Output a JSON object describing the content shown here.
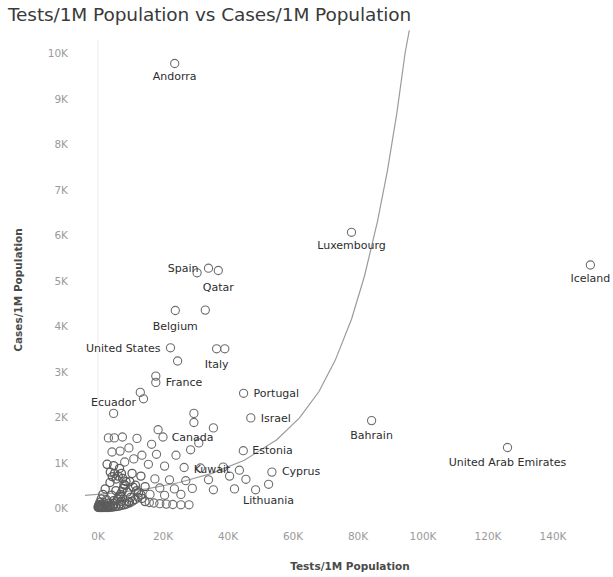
{
  "chart_data": {
    "type": "scatter",
    "title": "Tests/1M Population vs Cases/1M Population",
    "xlabel": "Tests/1M Population",
    "ylabel": "Cases/1M Population",
    "xlim": [
      -4000,
      150000
    ],
    "ylim": [
      0,
      10500
    ],
    "xticks": [
      "0K",
      "20K",
      "40K",
      "60K",
      "80K",
      "100K",
      "120K",
      "140K"
    ],
    "xtick_values": [
      0,
      20000,
      40000,
      60000,
      80000,
      100000,
      120000,
      140000
    ],
    "yticks": [
      "0K",
      "1K",
      "2K",
      "3K",
      "4K",
      "5K",
      "6K",
      "7K",
      "8K",
      "9K",
      "10K"
    ],
    "ytick_values": [
      0,
      1000,
      2000,
      3000,
      4000,
      5000,
      6000,
      7000,
      8000,
      9000,
      10000
    ],
    "grid": false,
    "legend": "none",
    "marker": "open-circle",
    "trendline": {
      "present": true,
      "style": "exponential-curve",
      "color": "#9b9b9b"
    },
    "labeled_points": [
      {
        "name": "Andorra",
        "x": 23600,
        "y": 9770,
        "label_dx": 0,
        "label_dy": 16,
        "label_anchor": "middle"
      },
      {
        "name": "Luxembourg",
        "x": 78000,
        "y": 6060,
        "label_dx": 0,
        "label_dy": 17,
        "label_anchor": "middle"
      },
      {
        "name": "Iceland",
        "x": 151500,
        "y": 5340,
        "label_dx": 0,
        "label_dy": 17,
        "label_anchor": "middle"
      },
      {
        "name": "Spain",
        "x": 34000,
        "y": 5270,
        "label_dx": -10,
        "label_dy": 4,
        "label_anchor": "end"
      },
      {
        "name": "Qatar",
        "x": 37000,
        "y": 5220,
        "label_dx": 0,
        "label_dy": 20,
        "label_anchor": "middle"
      },
      {
        "name": "Belgium",
        "x": 23800,
        "y": 4340,
        "label_dx": 0,
        "label_dy": 19,
        "label_anchor": "middle"
      },
      {
        "name": "United States",
        "x": 22300,
        "y": 3520,
        "label_dx": -10,
        "label_dy": 4,
        "label_anchor": "end"
      },
      {
        "name": "Italy",
        "x": 36500,
        "y": 3500,
        "label_dx": 0,
        "label_dy": 19,
        "label_anchor": "middle"
      },
      {
        "name": "France",
        "x": 17800,
        "y": 2760,
        "label_dx": 10,
        "label_dy": 4,
        "label_anchor": "start"
      },
      {
        "name": "Portugal",
        "x": 44800,
        "y": 2520,
        "label_dx": 10,
        "label_dy": 4,
        "label_anchor": "start"
      },
      {
        "name": "Ecuador",
        "x": 4800,
        "y": 2080,
        "label_dx": 0,
        "label_dy": -7,
        "label_anchor": "middle"
      },
      {
        "name": "Israel",
        "x": 47000,
        "y": 1980,
        "label_dx": 10,
        "label_dy": 4,
        "label_anchor": "start"
      },
      {
        "name": "Bahrain",
        "x": 84200,
        "y": 1920,
        "label_dx": 0,
        "label_dy": 18,
        "label_anchor": "middle"
      },
      {
        "name": "Canada",
        "x": 28500,
        "y": 1280,
        "label_dx": 2,
        "label_dy": -9,
        "label_anchor": "middle"
      },
      {
        "name": "Estonia",
        "x": 44700,
        "y": 1260,
        "label_dx": 9,
        "label_dy": 3,
        "label_anchor": "start"
      },
      {
        "name": "United Arab Emirates",
        "x": 126000,
        "y": 1330,
        "label_dx": 0,
        "label_dy": 18,
        "label_anchor": "middle"
      },
      {
        "name": "Kuwait",
        "x": 43500,
        "y": 830,
        "label_dx": -9,
        "label_dy": 3,
        "label_anchor": "end"
      },
      {
        "name": "Cyprus",
        "x": 53500,
        "y": 790,
        "label_dx": 10,
        "label_dy": 3,
        "label_anchor": "start"
      },
      {
        "name": "Lithuania",
        "x": 52500,
        "y": 520,
        "label_dx": 0,
        "label_dy": 20,
        "label_anchor": "middle"
      }
    ],
    "unlabeled_points": [
      {
        "x": 30500,
        "y": 5170
      },
      {
        "x": 33000,
        "y": 4350
      },
      {
        "x": 39000,
        "y": 3500
      },
      {
        "x": 17800,
        "y": 2900
      },
      {
        "x": 24500,
        "y": 3230
      },
      {
        "x": 13000,
        "y": 2540
      },
      {
        "x": 14000,
        "y": 2400
      },
      {
        "x": 29500,
        "y": 2080
      },
      {
        "x": 29500,
        "y": 1880
      },
      {
        "x": 12000,
        "y": 1530
      },
      {
        "x": 7500,
        "y": 1560
      },
      {
        "x": 5000,
        "y": 1540
      },
      {
        "x": 3200,
        "y": 1540
      },
      {
        "x": 18500,
        "y": 1720
      },
      {
        "x": 20000,
        "y": 1560
      },
      {
        "x": 35500,
        "y": 1760
      },
      {
        "x": 31000,
        "y": 1430
      },
      {
        "x": 16500,
        "y": 1400
      },
      {
        "x": 9500,
        "y": 1320
      },
      {
        "x": 6800,
        "y": 1250
      },
      {
        "x": 4300,
        "y": 1230
      },
      {
        "x": 13500,
        "y": 1160
      },
      {
        "x": 18000,
        "y": 1180
      },
      {
        "x": 24000,
        "y": 1160
      },
      {
        "x": 11000,
        "y": 1080
      },
      {
        "x": 8200,
        "y": 1010
      },
      {
        "x": 4800,
        "y": 930
      },
      {
        "x": 2800,
        "y": 960
      },
      {
        "x": 15500,
        "y": 960
      },
      {
        "x": 20500,
        "y": 920
      },
      {
        "x": 26500,
        "y": 890
      },
      {
        "x": 31500,
        "y": 880
      },
      {
        "x": 38500,
        "y": 900
      },
      {
        "x": 10500,
        "y": 760
      },
      {
        "x": 6200,
        "y": 700
      },
      {
        "x": 13200,
        "y": 700
      },
      {
        "x": 17500,
        "y": 640
      },
      {
        "x": 22000,
        "y": 620
      },
      {
        "x": 27000,
        "y": 600
      },
      {
        "x": 34000,
        "y": 620
      },
      {
        "x": 40500,
        "y": 700
      },
      {
        "x": 45500,
        "y": 630
      },
      {
        "x": 3700,
        "y": 560
      },
      {
        "x": 8000,
        "y": 520
      },
      {
        "x": 11500,
        "y": 500
      },
      {
        "x": 14500,
        "y": 470
      },
      {
        "x": 19000,
        "y": 440
      },
      {
        "x": 23500,
        "y": 420
      },
      {
        "x": 29000,
        "y": 430
      },
      {
        "x": 35500,
        "y": 400
      },
      {
        "x": 42000,
        "y": 420
      },
      {
        "x": 48500,
        "y": 400
      },
      {
        "x": 2200,
        "y": 420
      },
      {
        "x": 5500,
        "y": 380
      },
      {
        "x": 9000,
        "y": 350
      },
      {
        "x": 12500,
        "y": 330
      },
      {
        "x": 16000,
        "y": 300
      },
      {
        "x": 20500,
        "y": 280
      },
      {
        "x": 25500,
        "y": 300
      },
      {
        "x": 1500,
        "y": 300
      },
      {
        "x": 4200,
        "y": 280
      },
      {
        "x": 7000,
        "y": 250
      },
      {
        "x": 10000,
        "y": 230
      },
      {
        "x": 13500,
        "y": 210
      },
      {
        "x": 1000,
        "y": 200
      },
      {
        "x": 2600,
        "y": 180
      },
      {
        "x": 4800,
        "y": 160
      },
      {
        "x": 7200,
        "y": 150
      },
      {
        "x": 9500,
        "y": 140
      },
      {
        "x": 600,
        "y": 130
      },
      {
        "x": 1800,
        "y": 115
      },
      {
        "x": 3200,
        "y": 105
      },
      {
        "x": 5000,
        "y": 95
      },
      {
        "x": 6800,
        "y": 90
      },
      {
        "x": 400,
        "y": 80
      },
      {
        "x": 1200,
        "y": 72
      },
      {
        "x": 2200,
        "y": 66
      },
      {
        "x": 3400,
        "y": 60
      },
      {
        "x": 4700,
        "y": 58
      },
      {
        "x": 200,
        "y": 50
      },
      {
        "x": 800,
        "y": 46
      },
      {
        "x": 1600,
        "y": 42
      },
      {
        "x": 2500,
        "y": 38
      },
      {
        "x": 3600,
        "y": 36
      },
      {
        "x": 100,
        "y": 30
      },
      {
        "x": 500,
        "y": 28
      },
      {
        "x": 1100,
        "y": 26
      },
      {
        "x": 1900,
        "y": 24
      },
      {
        "x": 2800,
        "y": 22
      },
      {
        "x": 50,
        "y": 16
      },
      {
        "x": 350,
        "y": 14
      },
      {
        "x": 900,
        "y": 12
      },
      {
        "x": 1500,
        "y": 12
      },
      {
        "x": 2300,
        "y": 10
      },
      {
        "x": 3100,
        "y": 14
      },
      {
        "x": 3900,
        "y": 18
      },
      {
        "x": 4600,
        "y": 22
      },
      {
        "x": 5400,
        "y": 30
      },
      {
        "x": 6300,
        "y": 40
      },
      {
        "x": 7100,
        "y": 55
      },
      {
        "x": 8000,
        "y": 70
      },
      {
        "x": 8800,
        "y": 90
      },
      {
        "x": 9700,
        "y": 115
      },
      {
        "x": 10600,
        "y": 150
      },
      {
        "x": 11400,
        "y": 190
      },
      {
        "x": 12300,
        "y": 240
      },
      {
        "x": 13200,
        "y": 290
      },
      {
        "x": 6000,
        "y": 190
      },
      {
        "x": 6400,
        "y": 240
      },
      {
        "x": 6900,
        "y": 300
      },
      {
        "x": 7400,
        "y": 360
      },
      {
        "x": 7800,
        "y": 430
      },
      {
        "x": 8300,
        "y": 500
      },
      {
        "x": 8600,
        "y": 580
      },
      {
        "x": 7600,
        "y": 650
      },
      {
        "x": 7200,
        "y": 760
      },
      {
        "x": 6600,
        "y": 870
      },
      {
        "x": 14500,
        "y": 140
      },
      {
        "x": 15800,
        "y": 120
      },
      {
        "x": 17200,
        "y": 110
      },
      {
        "x": 19000,
        "y": 95
      },
      {
        "x": 21000,
        "y": 85
      },
      {
        "x": 23000,
        "y": 78
      },
      {
        "x": 25500,
        "y": 70
      },
      {
        "x": 28000,
        "y": 70
      },
      {
        "x": 5600,
        "y": 640
      },
      {
        "x": 5100,
        "y": 760
      },
      {
        "x": 4400,
        "y": 690
      },
      {
        "x": 3800,
        "y": 790
      },
      {
        "x": 9800,
        "y": 580
      },
      {
        "x": 10800,
        "y": 460
      },
      {
        "x": 11900,
        "y": 380
      }
    ],
    "trend_path_points": [
      {
        "x": -4000,
        "y": 280
      },
      {
        "x": 5000,
        "y": 330
      },
      {
        "x": 15000,
        "y": 420
      },
      {
        "x": 25000,
        "y": 560
      },
      {
        "x": 35000,
        "y": 760
      },
      {
        "x": 45000,
        "y": 1050
      },
      {
        "x": 55000,
        "y": 1500
      },
      {
        "x": 62000,
        "y": 1980
      },
      {
        "x": 68000,
        "y": 2560
      },
      {
        "x": 73000,
        "y": 3250
      },
      {
        "x": 78000,
        "y": 4150
      },
      {
        "x": 82000,
        "y": 5100
      },
      {
        "x": 86000,
        "y": 6300
      },
      {
        "x": 89000,
        "y": 7400
      },
      {
        "x": 92000,
        "y": 8700
      },
      {
        "x": 94500,
        "y": 10000
      },
      {
        "x": 95800,
        "y": 10500
      }
    ]
  }
}
